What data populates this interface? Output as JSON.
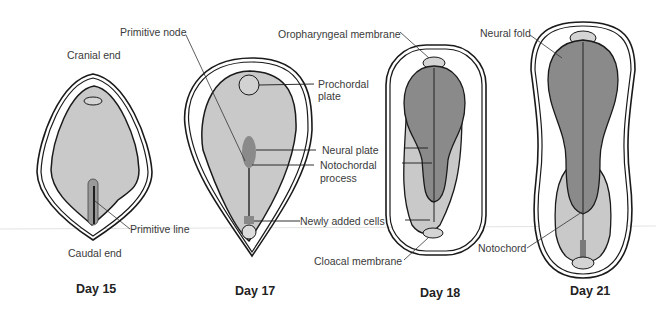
{
  "figure": {
    "panels": [
      {
        "day": "Day 15",
        "labels": {
          "cranial": "Cranial end",
          "caudal": "Caudal end",
          "primitive_line": "Primitive line"
        }
      },
      {
        "day": "Day 17",
        "labels": {
          "primitive_node": "Primitive node",
          "prochordal_1": "Prochordal",
          "prochordal_2": "plate",
          "neural_plate": "Neural plate",
          "notochordal_1": "Notochordal",
          "notochordal_2": "process",
          "newly_added": "Newly added cells"
        }
      },
      {
        "day": "Day 18",
        "labels": {
          "oropharyngeal": "Oropharyngeal membrane",
          "cloacal": "Cloacal membrane"
        }
      },
      {
        "day": "Day 21",
        "labels": {
          "neural_fold": "Neural fold",
          "notochord": "Notochord"
        }
      }
    ],
    "colors": {
      "light_gray": "#c9c9c9",
      "dark_gray": "#8a8a8a",
      "outline": "#1a1a1a"
    }
  }
}
